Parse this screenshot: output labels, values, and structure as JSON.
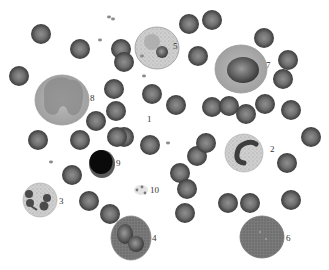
{
  "diagram": {
    "cell_labels": [
      {
        "id": "1",
        "text": "1",
        "kind": "erythrocyte"
      },
      {
        "id": "2",
        "text": "2",
        "kind": "neutrophil-band"
      },
      {
        "id": "3",
        "text": "3",
        "kind": "neutrophil-segmented"
      },
      {
        "id": "4",
        "text": "4",
        "kind": "eosinophil"
      },
      {
        "id": "5",
        "text": "5",
        "kind": "basophil"
      },
      {
        "id": "6",
        "text": "6",
        "kind": "monocyte-granular"
      },
      {
        "id": "7",
        "text": "7",
        "kind": "lymphocyte-large"
      },
      {
        "id": "8",
        "text": "8",
        "kind": "monocyte"
      },
      {
        "id": "9",
        "text": "9",
        "kind": "lymphocyte-small"
      },
      {
        "id": "10",
        "text": "10",
        "kind": "platelets"
      }
    ],
    "colors": {
      "background": "#ffffff",
      "rbc": "#6a6a6a",
      "rbc_highlight": "#9a9a9a",
      "label": "#333333"
    }
  }
}
